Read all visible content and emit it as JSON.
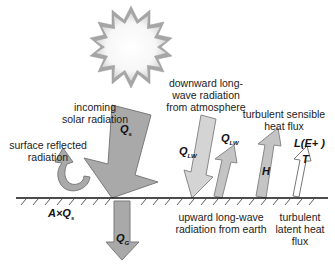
{
  "diagram": {
    "colors": {
      "arrow_fill": "#a9a9a9",
      "arrow_stroke": "#777777",
      "arrow_light": "#d2d2d2",
      "sun_ray": "#9e9e9e",
      "ground": "#111111"
    },
    "labels": {
      "incoming_solar": [
        "incoming",
        "solar radiation"
      ],
      "reflected": [
        "surface reflected",
        "radiation"
      ],
      "downward_lw": [
        "downward long-",
        "wave radiation",
        "from atmosphere"
      ],
      "sensible": [
        "turbulent sensible",
        "heat flux"
      ],
      "upward_lw": [
        "upward long-wave",
        "radiation from earth"
      ],
      "latent": [
        "turbulent",
        "latent heat",
        "flux"
      ]
    },
    "symbols": {
      "qs": {
        "main": "Q",
        "sub": "s"
      },
      "qlw": {
        "main": "Q",
        "sub": "LW"
      },
      "qlw_up": {
        "main": "Q",
        "sub": "LW"
      },
      "h": {
        "main": "H"
      },
      "le": {
        "main": "L(E+ )"
      },
      "t": {
        "main": "T"
      },
      "aqs": {
        "main": "A×Q",
        "sub": "s"
      },
      "qg": {
        "main": "Q",
        "sub": "G"
      }
    }
  }
}
